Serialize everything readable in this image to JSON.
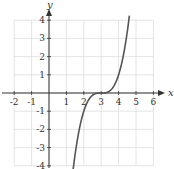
{
  "chart_data": {
    "type": "line",
    "title": "",
    "xlabel": "x",
    "ylabel": "y",
    "xlim": [
      -2,
      6
    ],
    "ylim": [
      -4,
      4
    ],
    "grid": true,
    "x_ticks": [
      -2,
      -1,
      1,
      2,
      3,
      4,
      5,
      6
    ],
    "y_ticks": [
      -4,
      -3,
      -2,
      -1,
      1,
      2,
      3,
      4
    ],
    "series": [
      {
        "name": "f(x) = (x-3)^3",
        "x": [
          1.4,
          1.6,
          1.8,
          2.0,
          2.2,
          2.4,
          2.6,
          2.8,
          3.0,
          3.2,
          3.4,
          3.6,
          3.8,
          4.0,
          4.2,
          4.4,
          4.6
        ],
        "values": [
          -4.1,
          -2.74,
          -1.73,
          -1.0,
          -0.51,
          -0.22,
          -0.06,
          -0.01,
          0.0,
          0.01,
          0.06,
          0.22,
          0.51,
          1.0,
          1.73,
          2.74,
          4.1
        ]
      }
    ]
  },
  "geometry": {
    "origin_px": [
      49,
      93
    ],
    "unit_x_px": 17.4,
    "unit_y_px": 18.2
  },
  "colors": {
    "grid": "#dddddd",
    "axis": "#333333",
    "curve": "#555555"
  }
}
